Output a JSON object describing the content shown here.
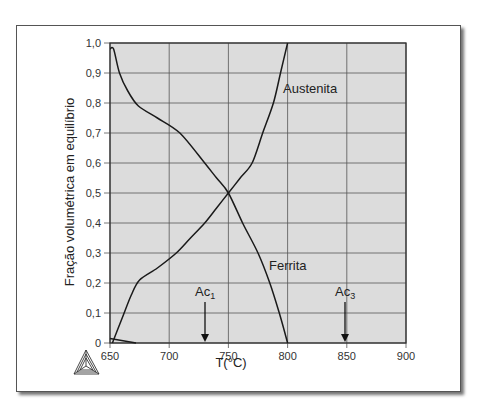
{
  "chart_data": {
    "type": "line",
    "title": "",
    "xlabel": "T(°C)",
    "ylabel": "Fração volumétrica em equilíbrio",
    "xlim": [
      650,
      900
    ],
    "ylim": [
      0,
      1.0
    ],
    "grid": true,
    "x_ticks": [
      "650",
      "700",
      "750",
      "800",
      "850",
      "900"
    ],
    "y_ticks": [
      "0",
      "0,1",
      "0,2",
      "0,3",
      "0,4",
      "0,5",
      "0,6",
      "0,7",
      "0,8",
      "0,9",
      "1,0"
    ],
    "series": [
      {
        "name": "Austenita",
        "x": [
          652,
          660,
          668,
          675,
          690,
          706,
          718,
          730,
          740,
          750,
          760,
          770,
          779,
          788,
          794,
          800
        ],
        "y": [
          0.0,
          0.08,
          0.16,
          0.21,
          0.25,
          0.3,
          0.35,
          0.4,
          0.45,
          0.5,
          0.55,
          0.6,
          0.7,
          0.8,
          0.9,
          1.0
        ]
      },
      {
        "name": "Ferrita",
        "x": [
          650,
          653,
          658,
          665,
          674,
          690,
          709,
          730,
          740,
          750,
          762,
          775,
          785,
          793,
          800
        ],
        "y": [
          0.98,
          0.98,
          0.9,
          0.84,
          0.79,
          0.75,
          0.7,
          0.6,
          0.55,
          0.5,
          0.4,
          0.3,
          0.2,
          0.1,
          0.0
        ]
      },
      {
        "name": "",
        "x": [
          650,
          672
        ],
        "y": [
          0.015,
          0.0
        ]
      }
    ],
    "annotations": [
      {
        "text": "Ac1",
        "base": "Ac",
        "sub": "1",
        "x": 730,
        "type": "arrow-down"
      },
      {
        "text": "Ac3",
        "base": "Ac",
        "sub": "3",
        "x": 848,
        "type": "arrow-down"
      },
      {
        "text": "Austenita",
        "x": 795,
        "y": 0.85
      },
      {
        "text": "Ferrita",
        "x": 783,
        "y": 0.22
      }
    ],
    "legend": null
  },
  "labels": {
    "xlabel": "T(°C)",
    "ylabel": "Fração volumétrica em equilíbrio",
    "austenita": "Austenita",
    "ferrita": "Ferrita",
    "ac1_base": "Ac",
    "ac1_sub": "1",
    "ac3_base": "Ac",
    "ac3_sub": "3"
  },
  "colors": {
    "plot_bg": "#dcdcdc",
    "grid": "#555555",
    "curve": "#1a1a1a",
    "frame_border": "#555555"
  },
  "logo": {
    "icon": "thermo-calc-triangle-icon"
  }
}
